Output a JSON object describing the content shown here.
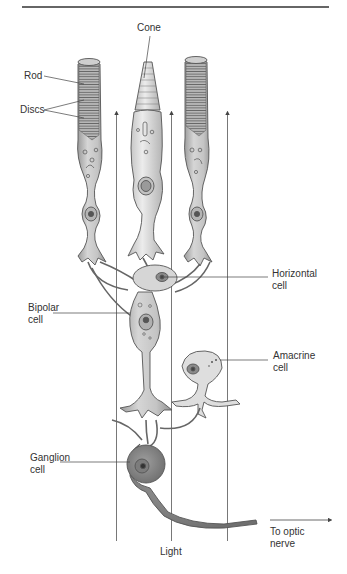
{
  "figure": {
    "labels": {
      "cone": "Cone",
      "rod": "Rod",
      "discs": "Discs",
      "horizontal_cell": "Horizontal\ncell",
      "bipolar_cell": "Bipolar\ncell",
      "amacrine_cell": "Amacrine\ncell",
      "ganglion_cell": "Ganglion\ncell",
      "to_optic_nerve": "To optic\nnerve",
      "light": "Light"
    },
    "colors": {
      "cell_fill": "#c9c9c9",
      "cell_fill_light": "#e2e2e2",
      "cell_fill_dark": "#8f8f8f",
      "outline": "#555555",
      "line": "#444444",
      "rule": "#333333"
    }
  }
}
